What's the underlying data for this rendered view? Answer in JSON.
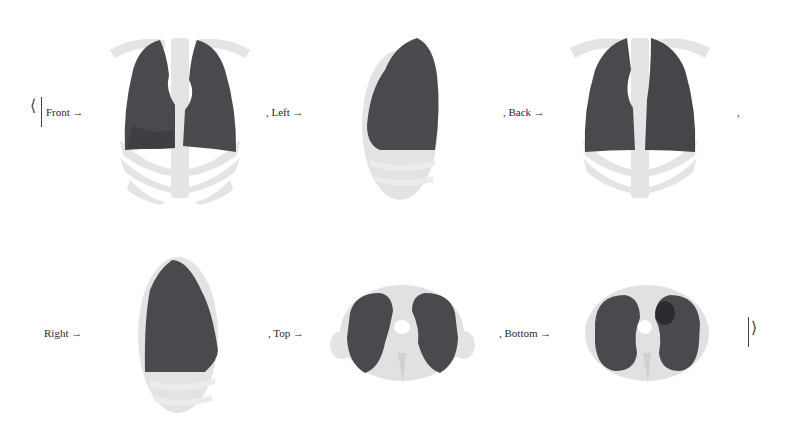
{
  "association": {
    "open_bracket": "⟨",
    "close_bracket": "⟩",
    "trailing_comma": ",",
    "entries": [
      {
        "key": "Front",
        "label": "Front →",
        "view": "front"
      },
      {
        "key": "Left",
        "label": ", Left →",
        "view": "left"
      },
      {
        "key": "Back",
        "label": ", Back →",
        "view": "back"
      },
      {
        "key": "Right",
        "label": "Right →",
        "view": "right"
      },
      {
        "key": "Top",
        "label": ", Top →",
        "view": "top"
      },
      {
        "key": "Bottom",
        "label": ", Bottom →",
        "view": "bottom"
      }
    ]
  },
  "colors": {
    "lung": "#4a4a4e",
    "bone": "#dcdcdc",
    "background": "#ffffff"
  }
}
